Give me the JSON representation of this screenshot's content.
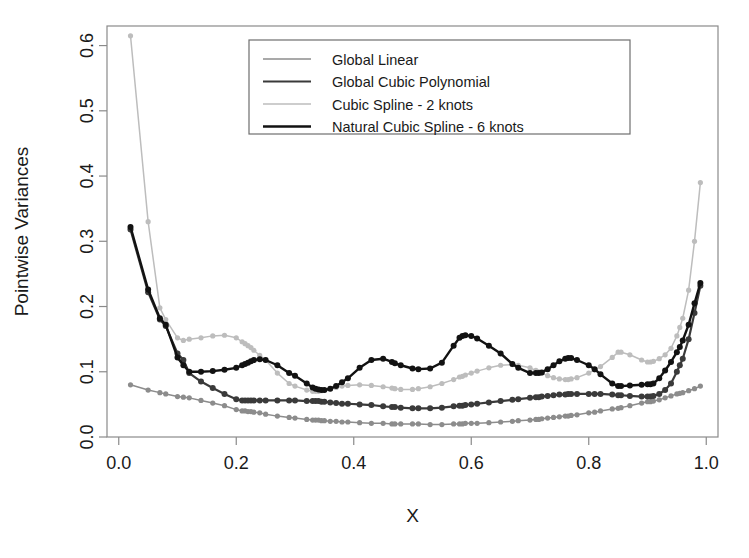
{
  "chart_data": {
    "type": "line",
    "title": "",
    "xlabel": "X",
    "ylabel": "Pointwise Variances",
    "xlim": [
      -0.02,
      1.02
    ],
    "ylim": [
      0.0,
      0.63
    ],
    "grid": false,
    "legend_position": "top-center",
    "xticks": [
      "0.0",
      "0.2",
      "0.4",
      "0.6",
      "0.8",
      "1.0"
    ],
    "xtick_values": [
      0.0,
      0.2,
      0.4,
      0.6,
      0.8,
      1.0
    ],
    "yticks": [
      "0.0",
      "0.1",
      "0.2",
      "0.3",
      "0.4",
      "0.5",
      "0.6"
    ],
    "ytick_values": [
      0.0,
      0.1,
      0.2,
      0.3,
      0.4,
      0.5,
      0.6
    ],
    "x": [
      0.02,
      0.05,
      0.07,
      0.08,
      0.1,
      0.11,
      0.12,
      0.14,
      0.16,
      0.18,
      0.2,
      0.21,
      0.215,
      0.22,
      0.225,
      0.23,
      0.24,
      0.25,
      0.27,
      0.29,
      0.3,
      0.32,
      0.33,
      0.335,
      0.34,
      0.345,
      0.35,
      0.36,
      0.37,
      0.38,
      0.39,
      0.41,
      0.43,
      0.45,
      0.465,
      0.47,
      0.48,
      0.5,
      0.51,
      0.53,
      0.55,
      0.57,
      0.58,
      0.585,
      0.59,
      0.6,
      0.61,
      0.63,
      0.65,
      0.67,
      0.68,
      0.7,
      0.71,
      0.715,
      0.72,
      0.73,
      0.74,
      0.75,
      0.76,
      0.765,
      0.77,
      0.78,
      0.8,
      0.81,
      0.82,
      0.84,
      0.85,
      0.855,
      0.87,
      0.89,
      0.9,
      0.905,
      0.91,
      0.92,
      0.93,
      0.94,
      0.95,
      0.955,
      0.96,
      0.97,
      0.98,
      0.99
    ],
    "series": [
      {
        "name": "Global Linear",
        "color": "#8c8c8c",
        "linewidth": 1.5,
        "marker": "circle",
        "values": [
          0.08,
          0.072,
          0.068,
          0.066,
          0.062,
          0.061,
          0.06,
          0.056,
          0.052,
          0.048,
          0.042,
          0.04,
          0.04,
          0.039,
          0.039,
          0.038,
          0.037,
          0.035,
          0.032,
          0.03,
          0.029,
          0.027,
          0.026,
          0.026,
          0.026,
          0.025,
          0.025,
          0.024,
          0.024,
          0.023,
          0.023,
          0.022,
          0.021,
          0.021,
          0.02,
          0.02,
          0.02,
          0.02,
          0.02,
          0.019,
          0.019,
          0.02,
          0.02,
          0.02,
          0.021,
          0.021,
          0.021,
          0.022,
          0.023,
          0.024,
          0.025,
          0.026,
          0.027,
          0.027,
          0.028,
          0.029,
          0.03,
          0.031,
          0.032,
          0.032,
          0.033,
          0.034,
          0.037,
          0.038,
          0.04,
          0.043,
          0.044,
          0.045,
          0.048,
          0.052,
          0.054,
          0.054,
          0.055,
          0.057,
          0.06,
          0.063,
          0.066,
          0.067,
          0.068,
          0.071,
          0.074,
          0.078
        ]
      },
      {
        "name": "Global Cubic Polynomial",
        "color": "#3a3a3a",
        "linewidth": 2.2,
        "marker": "circle",
        "values": [
          0.318,
          0.222,
          0.18,
          0.17,
          0.128,
          0.118,
          0.098,
          0.085,
          0.075,
          0.066,
          0.058,
          0.056,
          0.056,
          0.056,
          0.056,
          0.056,
          0.056,
          0.056,
          0.056,
          0.056,
          0.056,
          0.055,
          0.055,
          0.055,
          0.055,
          0.054,
          0.054,
          0.053,
          0.052,
          0.051,
          0.051,
          0.05,
          0.049,
          0.047,
          0.046,
          0.046,
          0.045,
          0.044,
          0.044,
          0.044,
          0.045,
          0.047,
          0.048,
          0.048,
          0.049,
          0.05,
          0.051,
          0.053,
          0.055,
          0.057,
          0.058,
          0.06,
          0.061,
          0.061,
          0.062,
          0.063,
          0.064,
          0.065,
          0.065,
          0.066,
          0.066,
          0.066,
          0.066,
          0.066,
          0.066,
          0.065,
          0.064,
          0.064,
          0.063,
          0.062,
          0.062,
          0.062,
          0.063,
          0.066,
          0.072,
          0.082,
          0.1,
          0.11,
          0.12,
          0.15,
          0.19,
          0.232
        ]
      },
      {
        "name": "Cubic Spline - 2 knots",
        "color": "#bdbdbd",
        "linewidth": 1.5,
        "marker": "circle",
        "values": [
          0.615,
          0.33,
          0.198,
          0.18,
          0.152,
          0.148,
          0.15,
          0.152,
          0.155,
          0.156,
          0.152,
          0.146,
          0.143,
          0.14,
          0.137,
          0.133,
          0.125,
          0.118,
          0.098,
          0.082,
          0.078,
          0.072,
          0.07,
          0.07,
          0.07,
          0.071,
          0.072,
          0.074,
          0.076,
          0.078,
          0.079,
          0.08,
          0.079,
          0.077,
          0.075,
          0.074,
          0.073,
          0.073,
          0.074,
          0.077,
          0.082,
          0.088,
          0.092,
          0.093,
          0.095,
          0.098,
          0.101,
          0.106,
          0.11,
          0.111,
          0.11,
          0.106,
          0.102,
          0.1,
          0.098,
          0.094,
          0.091,
          0.089,
          0.088,
          0.088,
          0.089,
          0.091,
          0.098,
          0.103,
          0.108,
          0.122,
          0.13,
          0.13,
          0.126,
          0.118,
          0.115,
          0.115,
          0.116,
          0.12,
          0.126,
          0.136,
          0.155,
          0.168,
          0.182,
          0.225,
          0.3,
          0.39
        ]
      },
      {
        "name": "Natural Cubic Spline - 6 knots",
        "color": "#121212",
        "linewidth": 2.4,
        "marker": "circle",
        "values": [
          0.322,
          0.226,
          0.182,
          0.172,
          0.122,
          0.11,
          0.1,
          0.1,
          0.101,
          0.103,
          0.106,
          0.11,
          0.112,
          0.114,
          0.116,
          0.118,
          0.119,
          0.118,
          0.11,
          0.098,
          0.094,
          0.082,
          0.076,
          0.074,
          0.073,
          0.072,
          0.072,
          0.074,
          0.078,
          0.084,
          0.09,
          0.106,
          0.118,
          0.12,
          0.115,
          0.113,
          0.11,
          0.105,
          0.104,
          0.105,
          0.114,
          0.14,
          0.152,
          0.155,
          0.156,
          0.155,
          0.151,
          0.14,
          0.128,
          0.112,
          0.106,
          0.098,
          0.098,
          0.098,
          0.099,
          0.104,
          0.11,
          0.116,
          0.12,
          0.121,
          0.121,
          0.118,
          0.11,
          0.104,
          0.096,
          0.082,
          0.078,
          0.078,
          0.079,
          0.08,
          0.081,
          0.081,
          0.082,
          0.09,
          0.102,
          0.115,
          0.13,
          0.138,
          0.148,
          0.172,
          0.205,
          0.236
        ]
      }
    ]
  },
  "legend": {
    "entries": [
      {
        "label": "Global Linear"
      },
      {
        "label": "Global Cubic Polynomial"
      },
      {
        "label": "Cubic Spline - 2 knots"
      },
      {
        "label": "Natural Cubic Spline - 6 knots"
      }
    ]
  },
  "axes": {
    "x_title": "X",
    "y_title": "Pointwise Variances"
  }
}
